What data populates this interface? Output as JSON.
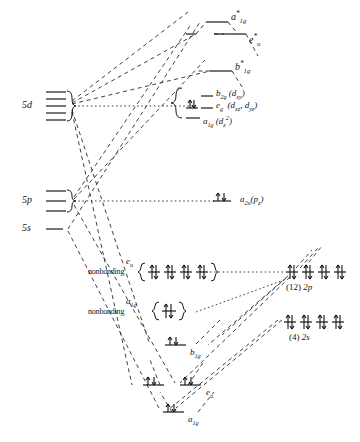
{
  "figure": {
    "type": "molecular-orbital-energy-level-diagram"
  },
  "metal_orbitals": [
    {
      "id": "5d",
      "label": "5d",
      "lines": 5,
      "brace": true
    },
    {
      "id": "5p",
      "label": "5p",
      "lines": 3,
      "brace": true
    },
    {
      "id": "5s",
      "label": "5s",
      "lines": 1,
      "brace": false
    }
  ],
  "ligand_orbitals": [
    {
      "id": "2p",
      "count_label": "(12)",
      "label": "2p",
      "levels": 4,
      "electrons": "pair"
    },
    {
      "id": "2s",
      "count_label": "(4)",
      "label": "2s",
      "levels": 4,
      "electrons": "pair"
    }
  ],
  "mo_levels": [
    {
      "id": "a1g-star",
      "base": "a",
      "sub": "1g",
      "star": true,
      "note": "antibonding",
      "electrons": 0
    },
    {
      "id": "eu-star",
      "base": "e",
      "sub": "u",
      "star": true,
      "note": "antibonding",
      "electrons": 0
    },
    {
      "id": "b1g-star",
      "base": "b",
      "sub": "1g",
      "star": true,
      "note": "antibonding",
      "electrons": 0
    },
    {
      "id": "b2g",
      "base": "b",
      "sub": "2g",
      "star": false,
      "parenthetical": "(d",
      "paren_sub": "xy",
      "paren_tail": ")",
      "electrons": 0
    },
    {
      "id": "eg",
      "base": "e",
      "sub": "g",
      "star": false,
      "parenthetical": "(d",
      "paren_sub": "xz",
      "paren_tail": ", d",
      "paren_sub2": "yz",
      "paren_tail2": ")",
      "electrons": 2
    },
    {
      "id": "a1g-d",
      "base": "a",
      "sub": "1g",
      "star": false,
      "parenthetical": "(d",
      "paren_sub": "z",
      "paren_sup": "2",
      "paren_tail": ")",
      "electrons": 0
    },
    {
      "id": "a2u",
      "base": "a",
      "sub": "2u",
      "star": false,
      "parenthetical": "(p",
      "paren_sub": "z",
      "paren_tail": ")",
      "electrons": 2
    },
    {
      "id": "eu-nb",
      "base": "e",
      "sub": "u",
      "star": false,
      "note": "nonbonding",
      "sublevels": 4,
      "electrons": 8
    },
    {
      "id": "a1g-nb",
      "base": "a",
      "sub": "1g",
      "star": false,
      "note": "nonbonding",
      "sublevels": 1,
      "electrons": 2
    },
    {
      "id": "b1g",
      "base": "b",
      "sub": "1g",
      "star": false,
      "note": "bonding",
      "electrons": 2
    },
    {
      "id": "eu-b",
      "base": "e",
      "sub": "u",
      "star": false,
      "note": "bonding",
      "electrons": 4,
      "sublevels": 2
    },
    {
      "id": "a1g-b",
      "base": "a",
      "sub": "1g",
      "star": false,
      "note": "bonding",
      "electrons": 2
    }
  ],
  "labels": {
    "nonbonding": "nonbonding",
    "o5d": "5d",
    "o5p": "5p",
    "o5s": "5s",
    "p_count": "(12)",
    "p_name": "2p",
    "s_count": "(4)",
    "s_name": "2s"
  },
  "colors": {
    "ink": "#1a1a1a",
    "dashed": "#2a2a2a",
    "background": "#ffffff"
  }
}
